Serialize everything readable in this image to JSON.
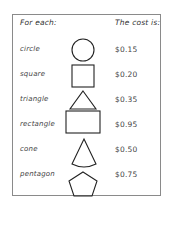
{
  "header": {
    "left": "For each:",
    "right": "The cost is:"
  },
  "rows": [
    {
      "name": "circle",
      "shape": "circle-icon",
      "price": "$0.15"
    },
    {
      "name": "square",
      "shape": "square-icon",
      "price": "$0.20"
    },
    {
      "name": "triangle",
      "shape": "triangle-icon",
      "price": "$0.35"
    },
    {
      "name": "rectangle",
      "shape": "rectangle-icon",
      "price": "$0.95"
    },
    {
      "name": "cone",
      "shape": "cone-icon",
      "price": "$0.50"
    },
    {
      "name": "pentagon",
      "shape": "pentagon-icon",
      "price": "$0.75"
    }
  ]
}
